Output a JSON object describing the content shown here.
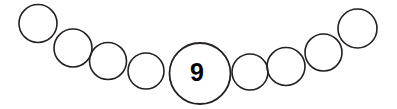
{
  "canvas": {
    "width": 397,
    "height": 109,
    "background_color": "#ffffff"
  },
  "style": {
    "stroke_color": "#241f20",
    "stroke_width": 1.6,
    "label_color": "#000000",
    "fill_color": "none"
  },
  "chart_data": {
    "type": "scatter",
    "title": "",
    "subtitle": "",
    "xlabel": "",
    "ylabel": "",
    "xlim": [
      0,
      397
    ],
    "ylim": [
      0,
      109
    ],
    "grid": false,
    "legend": "none",
    "annotations": [
      "9"
    ],
    "series": [
      {
        "name": "circle-chain",
        "points": [
          {
            "id": "circle-1",
            "cx": 38,
            "cy": 23.5,
            "r": 19,
            "label": ""
          },
          {
            "id": "circle-2",
            "cx": 73,
            "cy": 48,
            "r": 19,
            "label": ""
          },
          {
            "id": "circle-3",
            "cx": 108,
            "cy": 61,
            "r": 18.5,
            "label": ""
          },
          {
            "id": "circle-4",
            "cx": 146,
            "cy": 71,
            "r": 18,
            "label": ""
          },
          {
            "id": "circle-5",
            "cx": 200,
            "cy": 73.5,
            "r": 30.5,
            "label": "9"
          },
          {
            "id": "circle-6",
            "cx": 250,
            "cy": 72,
            "r": 18,
            "label": ""
          },
          {
            "id": "circle-7",
            "cx": 286,
            "cy": 66.5,
            "r": 19,
            "label": ""
          },
          {
            "id": "circle-8",
            "cx": 323.5,
            "cy": 52.5,
            "r": 18.5,
            "label": ""
          },
          {
            "id": "circle-9",
            "cx": 357.5,
            "cy": 28.5,
            "r": 19.5,
            "label": ""
          }
        ]
      }
    ]
  },
  "labels": {
    "center_value": "9",
    "center_label_x": 197,
    "center_label_y": 72
  }
}
